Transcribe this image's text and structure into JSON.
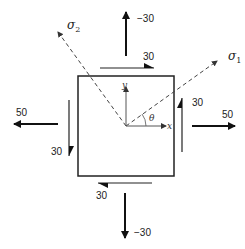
{
  "diagram": {
    "type": "stress-element",
    "normal_stresses": {
      "top": "−30",
      "bottom": "−30",
      "left": "50",
      "right": "50"
    },
    "shear_stresses": {
      "top": "30",
      "bottom": "30",
      "left": "30",
      "right": "30"
    },
    "principal_axes": {
      "sigma1": {
        "symbol": "σ",
        "subscript": "1"
      },
      "sigma2": {
        "symbol": "σ",
        "subscript": "2"
      }
    },
    "axes": {
      "x": "x",
      "y": "y",
      "angle": "θ"
    }
  }
}
